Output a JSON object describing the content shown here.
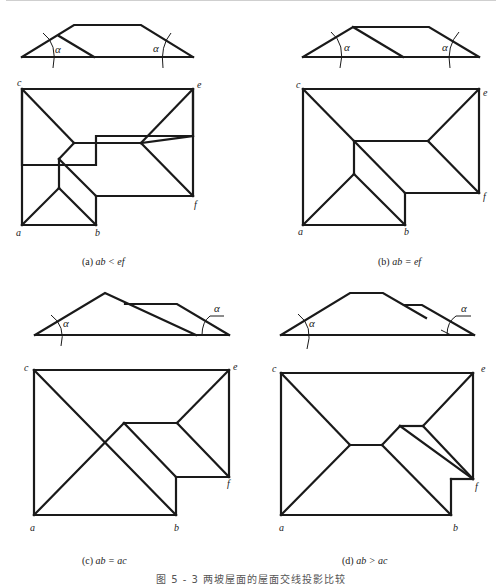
{
  "figure": {
    "caption": "图 5 - 3  两坡屋面的屋面交线投影比较",
    "angle_symbol": "α",
    "panels": [
      {
        "id": "a",
        "label": "(a)",
        "condition": "ab < ef",
        "vertices": {
          "a": "a",
          "b": "b",
          "c": "c",
          "e": "e",
          "f": "f"
        }
      },
      {
        "id": "b",
        "label": "(b)",
        "condition": "ab = ef",
        "vertices": {
          "a": "a",
          "b": "b",
          "c": "c",
          "e": "e",
          "f": "f"
        }
      },
      {
        "id": "c",
        "label": "(c)",
        "condition": "ab = ac",
        "vertices": {
          "a": "a",
          "b": "b",
          "c": "c",
          "e": "e",
          "f": "f"
        }
      },
      {
        "id": "d",
        "label": "(d)",
        "condition": "ab > ac",
        "vertices": {
          "a": "a",
          "b": "b",
          "c": "c",
          "e": "e",
          "f": "f"
        }
      }
    ]
  }
}
